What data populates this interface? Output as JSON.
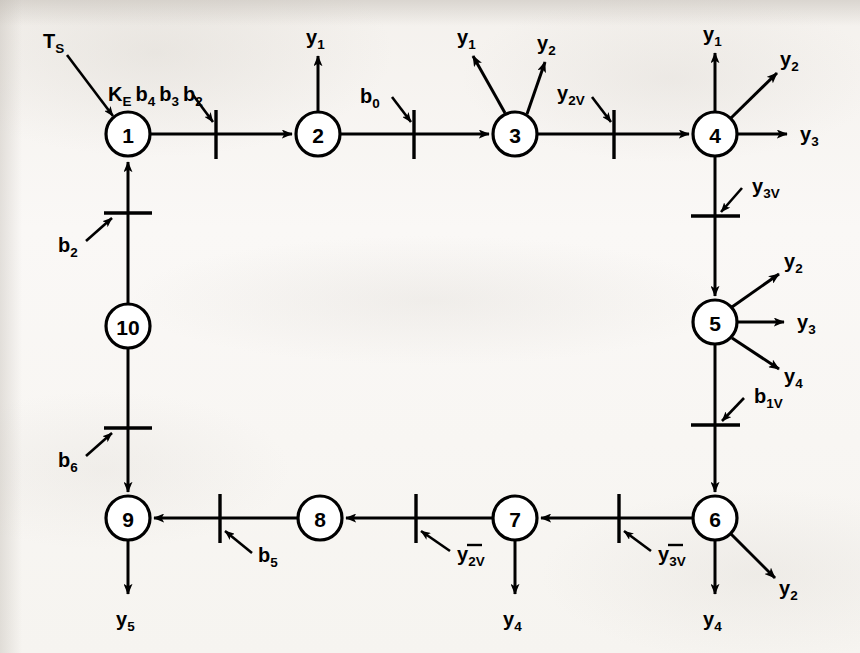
{
  "diagram": {
    "type": "flow-graph",
    "background_color": "#f7f5f2",
    "ink_color": "#000000",
    "nodes": [
      {
        "id": "1",
        "label": "1",
        "x": 128,
        "y": 134
      },
      {
        "id": "2",
        "label": "2",
        "x": 318,
        "y": 134
      },
      {
        "id": "3",
        "label": "3",
        "x": 515,
        "y": 134
      },
      {
        "id": "4",
        "label": "4",
        "x": 715,
        "y": 134
      },
      {
        "id": "5",
        "label": "5",
        "x": 715,
        "y": 322
      },
      {
        "id": "6",
        "label": "6",
        "x": 715,
        "y": 518
      },
      {
        "id": "7",
        "label": "7",
        "x": 515,
        "y": 518
      },
      {
        "id": "8",
        "label": "8",
        "x": 320,
        "y": 518
      },
      {
        "id": "9",
        "label": "9",
        "x": 128,
        "y": 518
      },
      {
        "id": "10",
        "label": "10",
        "x": 128,
        "y": 326
      }
    ],
    "edges": [
      {
        "from": "1",
        "to": "2",
        "direction": "right"
      },
      {
        "from": "2",
        "to": "3",
        "direction": "right"
      },
      {
        "from": "3",
        "to": "4",
        "direction": "right"
      },
      {
        "from": "4",
        "to": "5",
        "direction": "down"
      },
      {
        "from": "5",
        "to": "6",
        "direction": "down"
      },
      {
        "from": "6",
        "to": "7",
        "direction": "left"
      },
      {
        "from": "7",
        "to": "8",
        "direction": "left"
      },
      {
        "from": "8",
        "to": "9",
        "direction": "left"
      },
      {
        "from": "10",
        "to": "1",
        "direction": "up"
      },
      {
        "from": "10",
        "to": "9",
        "direction": "down"
      }
    ],
    "tick_inputs": [
      {
        "id": "tick-ke-b4-b3-b2",
        "edge": "1-2",
        "label": "K_E b4 b3 b2",
        "overbar": false
      },
      {
        "id": "tick-b0",
        "edge": "2-3",
        "label": "b0",
        "overbar": false
      },
      {
        "id": "tick-y2v",
        "edge": "3-4",
        "label": "y2V",
        "overbar": false
      },
      {
        "id": "tick-y3v",
        "edge": "4-5",
        "label": "y3V",
        "overbar": false
      },
      {
        "id": "tick-b1v",
        "edge": "5-6",
        "label": "b1V",
        "overbar": false
      },
      {
        "id": "tick-y3v-bar",
        "edge": "6-7",
        "label": "y3V",
        "overbar": true
      },
      {
        "id": "tick-y2v-bar",
        "edge": "7-8",
        "label": "y2V",
        "overbar": true
      },
      {
        "id": "tick-b5",
        "edge": "8-9",
        "label": "b5",
        "overbar": false
      },
      {
        "id": "tick-b2",
        "edge": "10-1",
        "label": "b2",
        "overbar": false
      },
      {
        "id": "tick-b6",
        "edge": "10-9",
        "label": "b6",
        "overbar": false
      }
    ],
    "external_input": {
      "id": "input-ts",
      "label": "TS",
      "target_node": "1"
    },
    "outputs": [
      {
        "id": "out-2-y1",
        "node": "2",
        "label": "y1",
        "direction": "up"
      },
      {
        "id": "out-3-y1",
        "node": "3",
        "label": "y1",
        "direction": "up-left"
      },
      {
        "id": "out-3-y2",
        "node": "3",
        "label": "y2",
        "direction": "up-right"
      },
      {
        "id": "out-4-y1",
        "node": "4",
        "label": "y1",
        "direction": "up"
      },
      {
        "id": "out-4-y2",
        "node": "4",
        "label": "y2",
        "direction": "up-right"
      },
      {
        "id": "out-4-y3",
        "node": "4",
        "label": "y3",
        "direction": "right"
      },
      {
        "id": "out-5-y2",
        "node": "5",
        "label": "y2",
        "direction": "up-right"
      },
      {
        "id": "out-5-y3",
        "node": "5",
        "label": "y3",
        "direction": "right"
      },
      {
        "id": "out-5-y4",
        "node": "5",
        "label": "y4",
        "direction": "down-right"
      },
      {
        "id": "out-6-y4",
        "node": "6",
        "label": "y4",
        "direction": "down"
      },
      {
        "id": "out-6-y2",
        "node": "6",
        "label": "y2",
        "direction": "down-right"
      },
      {
        "id": "out-7-y4",
        "node": "7",
        "label": "y4",
        "direction": "down"
      },
      {
        "id": "out-9-y5",
        "node": "9",
        "label": "y5",
        "direction": "down"
      }
    ],
    "label_text": {
      "ts_main": "T",
      "ts_sub": "S",
      "ke_main": "K",
      "ke_sub": "E",
      "b4_main": "b",
      "b4_sub": "4",
      "b3_main": "b",
      "b3_sub": "3",
      "b2_main": "b",
      "b2_sub": "2",
      "b0_main": "b",
      "b0_sub": "0",
      "b5_main": "b",
      "b5_sub": "5",
      "b6_main": "b",
      "b6_sub": "6",
      "b1v_main": "b",
      "b1v_sub": "1V",
      "y_main": "y",
      "y1_sub": "1",
      "y2_sub": "2",
      "y3_sub": "3",
      "y4_sub": "4",
      "y5_sub": "5",
      "y2v_sub": "2V",
      "y3v_sub": "3V"
    }
  }
}
